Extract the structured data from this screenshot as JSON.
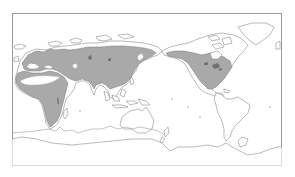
{
  "map": {
    "projection": "equirectangular, Pacific-centered",
    "frame": {
      "color": "#9a9a9a"
    },
    "colors": {
      "land_fill": "#ffffff",
      "coastline": "#8c8c8c",
      "range_fill": "#a9a9a9",
      "range_outline": "#7a7a7a"
    },
    "shaded_regions": [
      {
        "name": "Europe",
        "shaded": true
      },
      {
        "name": "Northern Africa (excluding Sahara interior)",
        "shaded": true
      },
      {
        "name": "Sub-Saharan Africa",
        "shaded": true
      },
      {
        "name": "Middle East",
        "shaded": true
      },
      {
        "name": "Northern and Central Asia",
        "shaded": true
      },
      {
        "name": "East Asia",
        "shaded": true
      },
      {
        "name": "Alaska (southern)",
        "shaded": true
      },
      {
        "name": "Canada (southern)",
        "shaded": true
      },
      {
        "name": "United States",
        "shaded": true
      },
      {
        "name": "Mexico",
        "shaded": true
      }
    ],
    "unshaded_regions": [
      "Sahara desert core",
      "Arctic Canada and Greenland",
      "Siberian arctic coast",
      "Southeast Asia islands",
      "Australia",
      "South America",
      "Antarctica"
    ],
    "labels": []
  }
}
